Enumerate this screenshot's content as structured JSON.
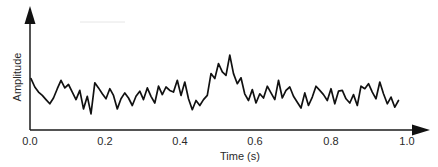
{
  "chart_data": {
    "type": "line",
    "title": "",
    "xlabel": "Time (s)",
    "ylabel": "Amplitude",
    "xlim": [
      0.0,
      1.0
    ],
    "ylim": null,
    "grid": false,
    "legend": null,
    "x_ticks": [
      "0.0",
      "0.2",
      "0.4",
      "0.6",
      "0.8",
      "1.0"
    ],
    "y_ticks": [],
    "annotations": [],
    "series": [
      {
        "name": "signal",
        "color": "#111111",
        "x": [
          0.0,
          0.01,
          0.02,
          0.03,
          0.04,
          0.05,
          0.06,
          0.07,
          0.08,
          0.09,
          0.1,
          0.11,
          0.12,
          0.13,
          0.14,
          0.15,
          0.16,
          0.17,
          0.18,
          0.19,
          0.2,
          0.21,
          0.22,
          0.23,
          0.24,
          0.25,
          0.26,
          0.27,
          0.28,
          0.29,
          0.3,
          0.31,
          0.32,
          0.33,
          0.34,
          0.35,
          0.36,
          0.37,
          0.38,
          0.39,
          0.4,
          0.41,
          0.42,
          0.43,
          0.44,
          0.45,
          0.46,
          0.47,
          0.48,
          0.49,
          0.5,
          0.51,
          0.52,
          0.53,
          0.54,
          0.55,
          0.56,
          0.57,
          0.58,
          0.59,
          0.6,
          0.61,
          0.62,
          0.63,
          0.64,
          0.65,
          0.66,
          0.67,
          0.68,
          0.69,
          0.7,
          0.71,
          0.72,
          0.73,
          0.74,
          0.75,
          0.76,
          0.77,
          0.78,
          0.79,
          0.8,
          0.81,
          0.82,
          0.83,
          0.84,
          0.85,
          0.86,
          0.87,
          0.88,
          0.89,
          0.9,
          0.91,
          0.92,
          0.93,
          0.94,
          0.95,
          0.96,
          0.97,
          0.98
        ],
        "values": [
          0.54,
          0.44,
          0.38,
          0.34,
          0.29,
          0.24,
          0.31,
          0.42,
          0.52,
          0.43,
          0.47,
          0.38,
          0.29,
          0.4,
          0.18,
          0.33,
          0.12,
          0.49,
          0.43,
          0.36,
          0.3,
          0.42,
          0.34,
          0.18,
          0.3,
          0.37,
          0.31,
          0.22,
          0.33,
          0.39,
          0.29,
          0.43,
          0.33,
          0.25,
          0.45,
          0.35,
          0.44,
          0.4,
          0.38,
          0.52,
          0.34,
          0.5,
          0.3,
          0.17,
          0.28,
          0.22,
          0.29,
          0.34,
          0.6,
          0.54,
          0.72,
          0.62,
          0.58,
          0.82,
          0.6,
          0.48,
          0.55,
          0.36,
          0.28,
          0.41,
          0.25,
          0.36,
          0.31,
          0.45,
          0.37,
          0.29,
          0.52,
          0.31,
          0.4,
          0.44,
          0.33,
          0.26,
          0.19,
          0.37,
          0.22,
          0.32,
          0.45,
          0.4,
          0.35,
          0.28,
          0.42,
          0.24,
          0.39,
          0.4,
          0.3,
          0.25,
          0.35,
          0.22,
          0.45,
          0.42,
          0.48,
          0.38,
          0.3,
          0.5,
          0.36,
          0.24,
          0.32,
          0.2,
          0.28
        ]
      }
    ]
  },
  "axes": {
    "x_label": "Time (s)",
    "y_label": "Amplitude",
    "x_tick_labels": [
      "0.0",
      "0.2",
      "0.4",
      "0.6",
      "0.8",
      "1.0"
    ]
  }
}
